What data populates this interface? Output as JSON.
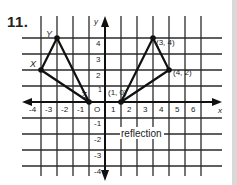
{
  "problem": {
    "number": "11."
  },
  "diagram": {
    "type": "coordinate-grid-reflection",
    "caption": "reflection",
    "axes": {
      "x_label": "x",
      "y_label": "y",
      "origin_label": "O"
    },
    "x_ticks": [
      "-4",
      "-3",
      "-2",
      "-1",
      "O",
      "1",
      "2",
      "3",
      "4",
      "5",
      "6"
    ],
    "y_ticks": [
      "4",
      "3",
      "2",
      "1",
      "-1",
      "-2",
      "-3",
      "-4"
    ],
    "original_triangle": {
      "vertices": [
        {
          "name": "X",
          "x": -4,
          "y": 2
        },
        {
          "name": "Y",
          "x": -3,
          "y": 4
        },
        {
          "name": "Z",
          "x": -1,
          "y": 0
        }
      ]
    },
    "image_triangle": {
      "vertices": [
        {
          "label": "(1, 0)",
          "x": 1,
          "y": 0
        },
        {
          "label": "(3, 4)",
          "x": 3,
          "y": 4
        },
        {
          "label": "(4, 2)",
          "x": 4,
          "y": 2
        }
      ]
    },
    "colors": {
      "ink": "#1a1a1a",
      "grid": "#2a2a2a",
      "side_band": "#d9d9d9"
    }
  }
}
